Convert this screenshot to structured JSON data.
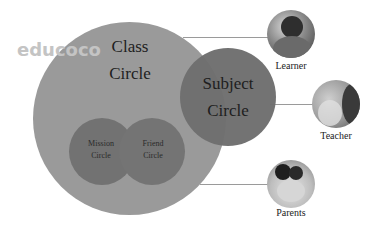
{
  "watermark": "educoco",
  "diagram": {
    "class_circle": {
      "line1": "Class",
      "line2": "Circle",
      "color": "#9a9a9a"
    },
    "subject_circle": {
      "line1": "Subject",
      "line2": "Circle",
      "color": "#6e6e6e"
    },
    "mission_circle": {
      "line1": "Mission",
      "line2": "Circle",
      "color": "#727272"
    },
    "friend_circle": {
      "line1": "Friend",
      "line2": "Circle",
      "color": "#747474"
    },
    "roles": [
      {
        "label": "Learner",
        "icon": "learner-photo"
      },
      {
        "label": "Teacher",
        "icon": "teacher-photo"
      },
      {
        "label": "Parents",
        "icon": "parents-photo"
      }
    ],
    "connector_color": "#9a9a9a"
  }
}
